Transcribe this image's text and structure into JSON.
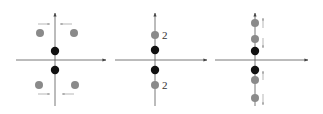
{
  "colors": {
    "axis": "#555555",
    "black_dot": "#111111",
    "gray_dot": "#8a8a8a",
    "arrow": "#999999"
  },
  "panels": [
    {
      "id": "panel-1",
      "description": "Four gray points off-axis with arrows pointing toward vertical axis; two black points on axis",
      "black_dots": [
        [
          55,
          51
        ],
        [
          55,
          70
        ]
      ],
      "gray_dots": [
        [
          40,
          33
        ],
        [
          74,
          33
        ],
        [
          39,
          85
        ],
        [
          75,
          85
        ]
      ],
      "arrows": "inward horizontal"
    },
    {
      "id": "panel-2",
      "description": "Gray points merged on vertical axis with multiplicity labels",
      "labels": [
        "2",
        "2"
      ],
      "black_dots": [
        [
          155,
          50
        ],
        [
          155,
          70
        ]
      ],
      "gray_dots": [
        [
          155,
          35
        ],
        [
          155,
          85
        ]
      ]
    },
    {
      "id": "panel-3",
      "description": "Gray points split along vertical axis with small vertical arrows",
      "black_dots": [
        [
          255,
          51
        ],
        [
          255,
          70
        ]
      ],
      "gray_dots": [
        [
          255,
          23
        ],
        [
          255,
          39
        ],
        [
          255,
          79
        ],
        [
          255,
          98
        ]
      ],
      "arrows": "vertical splitting"
    }
  ]
}
